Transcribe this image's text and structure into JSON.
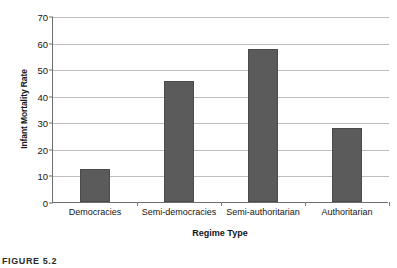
{
  "chart_data": {
    "type": "bar",
    "title": "",
    "categories": [
      "Democracies",
      "Semi-democracies",
      "Semi-authoritarian",
      "Authoritarian"
    ],
    "values": [
      12.5,
      45.5,
      57.5,
      28.0
    ],
    "xlabel": "Regime Type",
    "ylabel": "Infant Mortality Rate",
    "ylim": [
      0,
      70
    ],
    "yticks": [
      0,
      10,
      20,
      30,
      40,
      50,
      60,
      70
    ],
    "ytick_labels": [
      "0",
      "10",
      "20",
      "30",
      "40",
      "50",
      "60",
      "70"
    ],
    "grid": true,
    "legend": false,
    "bar_color": "#5b5b5b",
    "grid_color": "#bdbdbd",
    "axis_color": "#6e6e6e"
  },
  "caption": {
    "text": "FIGURE 5.2"
  }
}
